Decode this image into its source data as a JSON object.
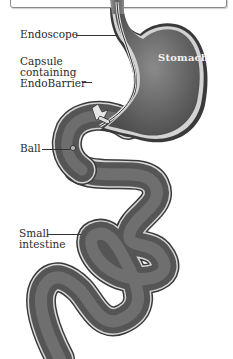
{
  "figure": {
    "title": "",
    "labels": {
      "endoscope": "Endoscope",
      "capsule": "Capsule\ncontaining\nEndoBarrier",
      "ball": "Ball",
      "small_intestine": "Small\nintestine",
      "stomach": "Stomach"
    },
    "colors": {
      "organ_fill": "#6b6b6b",
      "organ_dark": "#4a4a4a",
      "wall": "#bdbdbd",
      "outline": "#3c3c3c",
      "background": "#ffffff"
    }
  }
}
